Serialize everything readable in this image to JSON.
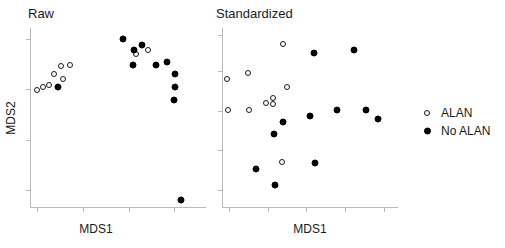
{
  "figure": {
    "background": "#ffffff",
    "point_color_filled": "#000000",
    "point_color_open": "#ffffff",
    "point_stroke": "#1a1a1a",
    "axis_color": "#b9b9b9"
  },
  "legend": {
    "position": "right",
    "entries": [
      {
        "label": "ALAN",
        "marker": "open-circle"
      },
      {
        "label": "No ALAN",
        "marker": "filled-circle"
      }
    ]
  },
  "chart_data": [
    {
      "type": "scatter",
      "title": "Raw",
      "xlabel": "MDS1",
      "ylabel": "MDS2",
      "xlim": [
        0,
        1
      ],
      "ylim": [
        0,
        1
      ],
      "grid": false,
      "x_ticks": [
        0.04,
        0.3,
        0.56,
        0.82
      ],
      "y_ticks": [
        0.1,
        0.38,
        0.66,
        0.94
      ],
      "legend_position": "right-outside",
      "series": [
        {
          "name": "ALAN",
          "marker": "open-circle",
          "points": [
            {
              "x": 0.038,
              "y": 0.655
            },
            {
              "x": 0.075,
              "y": 0.672
            },
            {
              "x": 0.108,
              "y": 0.685
            },
            {
              "x": 0.135,
              "y": 0.742
            },
            {
              "x": 0.178,
              "y": 0.788
            },
            {
              "x": 0.225,
              "y": 0.795
            },
            {
              "x": 0.185,
              "y": 0.715
            },
            {
              "x": 0.16,
              "y": 0.672
            },
            {
              "x": 0.6,
              "y": 0.858
            },
            {
              "x": 0.672,
              "y": 0.878
            }
          ]
        },
        {
          "name": "No ALAN",
          "marker": "filled-circle",
          "points": [
            {
              "x": 0.158,
              "y": 0.672
            },
            {
              "x": 0.53,
              "y": 0.94
            },
            {
              "x": 0.638,
              "y": 0.905
            },
            {
              "x": 0.592,
              "y": 0.878
            },
            {
              "x": 0.588,
              "y": 0.795
            },
            {
              "x": 0.718,
              "y": 0.795
            },
            {
              "x": 0.78,
              "y": 0.812
            },
            {
              "x": 0.822,
              "y": 0.745
            },
            {
              "x": 0.822,
              "y": 0.672
            },
            {
              "x": 0.818,
              "y": 0.598
            },
            {
              "x": 0.858,
              "y": 0.042
            }
          ]
        }
      ]
    },
    {
      "type": "scatter",
      "title": "Standardized",
      "xlabel": "MDS1",
      "ylabel": "",
      "xlim": [
        0,
        1
      ],
      "ylim": [
        0,
        1
      ],
      "grid": false,
      "x_ticks": [
        0.04,
        0.26,
        0.48,
        0.7,
        0.92
      ],
      "y_ticks": [
        0.1,
        0.32,
        0.54,
        0.76,
        0.96
      ],
      "legend_position": "right-outside",
      "series": [
        {
          "name": "ALAN",
          "marker": "open-circle",
          "points": [
            {
              "x": 0.028,
              "y": 0.718
            },
            {
              "x": 0.035,
              "y": 0.545
            },
            {
              "x": 0.15,
              "y": 0.748
            },
            {
              "x": 0.155,
              "y": 0.545
            },
            {
              "x": 0.25,
              "y": 0.585
            },
            {
              "x": 0.288,
              "y": 0.61
            },
            {
              "x": 0.29,
              "y": 0.578
            },
            {
              "x": 0.345,
              "y": 0.912
            },
            {
              "x": 0.372,
              "y": 0.675
            },
            {
              "x": 0.34,
              "y": 0.258
            }
          ]
        },
        {
          "name": "No ALAN",
          "marker": "filled-circle",
          "points": [
            {
              "x": 0.192,
              "y": 0.215
            },
            {
              "x": 0.302,
              "y": 0.128
            },
            {
              "x": 0.298,
              "y": 0.41
            },
            {
              "x": 0.348,
              "y": 0.478
            },
            {
              "x": 0.522,
              "y": 0.862
            },
            {
              "x": 0.498,
              "y": 0.512
            },
            {
              "x": 0.53,
              "y": 0.252
            },
            {
              "x": 0.655,
              "y": 0.545
            },
            {
              "x": 0.748,
              "y": 0.878
            },
            {
              "x": 0.818,
              "y": 0.545
            },
            {
              "x": 0.885,
              "y": 0.495
            }
          ]
        }
      ]
    }
  ]
}
